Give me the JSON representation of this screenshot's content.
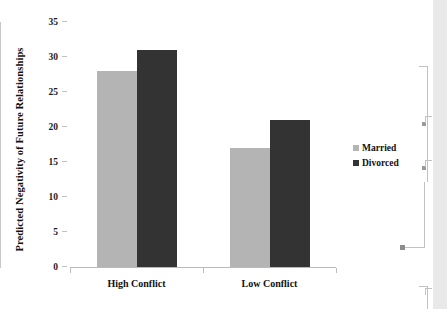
{
  "chart_data": {
    "type": "bar",
    "title": "",
    "xlabel": "",
    "ylabel": "Predicted Negativity of Future Relationships",
    "categories": [
      "High Conflict",
      "Low Conflict"
    ],
    "series": [
      {
        "name": "Married",
        "values": [
          28,
          17
        ],
        "color": "#b4b4b4"
      },
      {
        "name": "Divorced",
        "values": [
          31,
          21
        ],
        "color": "#333333"
      }
    ],
    "ylim": [
      0,
      35
    ],
    "yticks": [
      0,
      5,
      10,
      15,
      20,
      25,
      30,
      35
    ],
    "ytick_labels": [
      "0",
      "5",
      "10",
      "15",
      "20",
      "25",
      "30",
      "35"
    ],
    "grid": false,
    "legend_position": "right"
  },
  "legend": {
    "items": [
      {
        "label": "Married",
        "swatch": "married-swatch"
      },
      {
        "label": "Divorced",
        "swatch": "divorced-swatch"
      }
    ]
  },
  "document_chrome": {
    "anchor_marker": "object-anchor-dot",
    "margin_bar": "change-bar"
  }
}
